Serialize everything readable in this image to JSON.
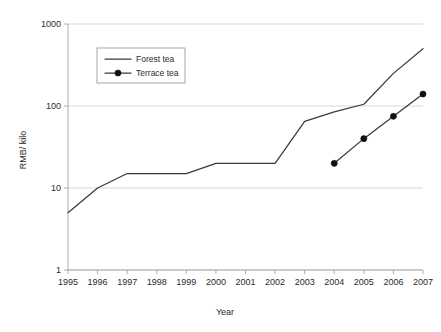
{
  "chart_data": {
    "type": "line",
    "title": "",
    "xlabel": "Year",
    "ylabel": "RMB/ kilo",
    "x": [
      1995,
      1996,
      1997,
      1998,
      1999,
      2000,
      2001,
      2002,
      2003,
      2004,
      2005,
      2006,
      2007
    ],
    "categories": [
      "1995",
      "1996",
      "1997",
      "1998",
      "1999",
      "2000",
      "2001",
      "2002",
      "2003",
      "2004",
      "2005",
      "2006",
      "2007"
    ],
    "yscale": "log",
    "ylim": [
      1,
      1000
    ],
    "yticks": [
      1,
      10,
      100,
      1000
    ],
    "ytick_labels": [
      "1",
      "10",
      "100",
      "1000"
    ],
    "grid": true,
    "grid_axis": "y",
    "legend_position": "upper left inside",
    "series": [
      {
        "name": "Forest tea",
        "marker": "none",
        "x": [
          1995,
          1996,
          1997,
          1998,
          1999,
          2000,
          2001,
          2002,
          2003,
          2004,
          2005,
          2006,
          2007
        ],
        "values": [
          5,
          10,
          15,
          15,
          15,
          20,
          20,
          20,
          65,
          85,
          105,
          250,
          500
        ]
      },
      {
        "name": "Terrace tea",
        "marker": "filled-circle",
        "x": [
          2004,
          2005,
          2006,
          2007
        ],
        "values": [
          20,
          40,
          75,
          140
        ]
      }
    ],
    "colors": {
      "series_line": "#3a3a3a",
      "marker": "#111111",
      "gridline": "#c8c8c8",
      "axis": "#9a9a9a",
      "text": "#2b2b2b",
      "background": "#ffffff"
    }
  },
  "legend": {
    "entries": [
      {
        "label": "Forest tea"
      },
      {
        "label": "Terrace tea"
      }
    ]
  },
  "axes": {
    "y_title": "RMB/ kilo",
    "x_title": "Year",
    "y_ticks": [
      "1000",
      "100",
      "10",
      "1"
    ],
    "x_ticks": [
      "1995",
      "1996",
      "1997",
      "1998",
      "1999",
      "2000",
      "2001",
      "2002",
      "2003",
      "2004",
      "2005",
      "2006",
      "2007"
    ]
  }
}
